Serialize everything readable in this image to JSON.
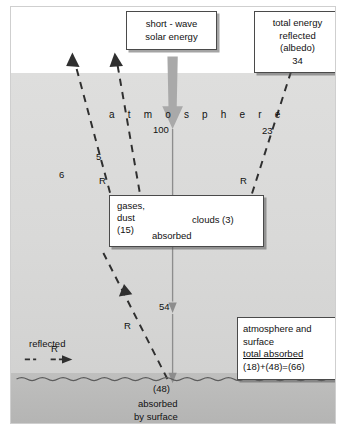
{
  "diagram": {
    "title_box": {
      "line1": "short - wave",
      "line2": "solar energy"
    },
    "albedo_box": {
      "line1": "total energy",
      "line2": "reflected",
      "line3": "(albedo)",
      "line4": "34"
    },
    "atmosphere_label": "a t m o s p h e r e",
    "incoming_value": "100",
    "left_flux_value": "5",
    "left_flux_symbol": "R",
    "outer_flux_value": "6",
    "right_flux_value": "23",
    "right_flux_symbol": "R",
    "surface_reflect_symbol": "R",
    "transmitted_value": "54",
    "gases_box": {
      "gases_line1": "gases,",
      "gases_line2": "dust",
      "gases_line3": "(15)",
      "clouds": "clouds (3)",
      "absorbed": "absorbed"
    },
    "surface": {
      "value": "(48)",
      "line1": "absorbed",
      "line2": "by surface"
    },
    "totals_box": {
      "line1": "atmosphere and surface",
      "line2": "total absorbed",
      "line3": "(18)+(48)=(66)"
    },
    "legend": {
      "label": "reflected",
      "symbol": "R"
    },
    "colors": {
      "atmosphere": "#d9d9d8",
      "ground": "#b8b8b7",
      "arrow_grey": "#a8a8a8",
      "line_dark": "#3a3a3a"
    }
  }
}
